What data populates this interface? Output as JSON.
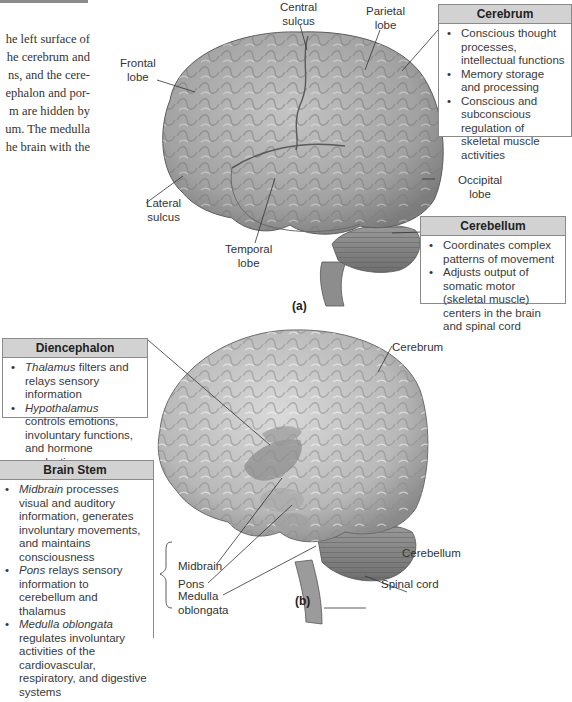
{
  "body_text": {
    "lines": [
      "he left surface of",
      "he cerebrum and",
      "ns, and the cere-",
      "ephalon and por-",
      "m are hidden by",
      "um. The medulla",
      "he brain with the"
    ]
  },
  "panel_a": {
    "label": "(a)",
    "structure_labels": {
      "frontal_lobe": [
        "Frontal",
        "lobe"
      ],
      "central_sulcus": [
        "Central",
        "sulcus"
      ],
      "parietal_lobe": [
        "Parietal",
        "lobe"
      ],
      "occipital_lobe": [
        "Occipital",
        "lobe"
      ],
      "lateral_sulcus": [
        "Lateral",
        "sulcus"
      ],
      "temporal_lobe": [
        "Temporal",
        "lobe"
      ]
    },
    "cerebrum_box": {
      "title": "Cerebrum",
      "items": [
        "Conscious thought processes, intellectual functions",
        "Memory storage and processing",
        "Conscious and subconscious regulation of skeletal muscle activities"
      ]
    },
    "cerebellum_box": {
      "title": "Cerebellum",
      "items": [
        "Coordinates complex patterns of movement",
        "Adjusts output of somatic motor (skeletal muscle) centers in the brain and spinal cord"
      ]
    }
  },
  "panel_b": {
    "label": "(b)",
    "structure_labels": {
      "cerebrum": "Cerebrum",
      "midbrain": "Midbrain",
      "pons": "Pons",
      "medulla_oblongata": [
        "Medulla",
        "oblongata"
      ],
      "cerebellum": "Cerebellum",
      "spinal_cord": "Spinal cord"
    },
    "diencephalon_box": {
      "title": "Diencephalon",
      "items": [
        {
          "term": "Thalamus",
          "text": " filters and relays sensory information"
        },
        {
          "term": "Hypothalamus",
          "text": " controls emotions, involuntary functions, and hormone production"
        }
      ]
    },
    "brain_stem_box": {
      "title": "Brain Stem",
      "items": [
        {
          "term": "Midbrain",
          "text": " processes visual and auditory information, generates involuntary movements, and maintains consciousness"
        },
        {
          "term": "Pons",
          "text": " relays sensory information to cerebellum and thalamus"
        },
        {
          "term": "Medulla oblongata",
          "text": " regulates involuntary activities of the cardiovascular, respiratory, and digestive systems"
        }
      ]
    }
  },
  "colors": {
    "brain_fill": "#a9a9a9",
    "brain_light": "#c8c8c8",
    "box_header": "#d2d2d2",
    "box_border": "#8a8a8a",
    "diencephalon_highlight": "#8e8e8e"
  }
}
